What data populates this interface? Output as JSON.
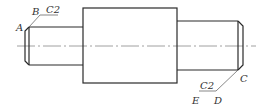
{
  "diagram": {
    "colors": {
      "line": "#2a2a2a",
      "thin": "#555555",
      "center": "#888888",
      "background": "#ffffff"
    },
    "labels": {
      "A": "A",
      "B": "B",
      "C": "C",
      "D": "D",
      "E": "E",
      "chamfer_left": "C2",
      "chamfer_right": "C2"
    }
  }
}
